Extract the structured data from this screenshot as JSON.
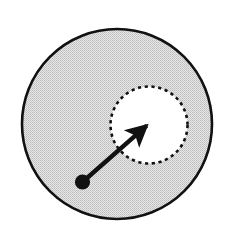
{
  "figure": {
    "canvas": {
      "width": 236,
      "height": 243,
      "background": "#ffffff"
    }
  },
  "shapes": {
    "outer_disk": {
      "name": "outer-disk",
      "role": "filled region boundary",
      "cx": 117,
      "cy": 124,
      "r": 95,
      "fill": "#d4d4d4",
      "fill_style": "halftone-dither",
      "stroke": "#111111",
      "stroke_width": 2.6,
      "stroke_style": "solid"
    },
    "inner_disk": {
      "name": "inner-disk",
      "role": "excluded hole",
      "cx": 149,
      "cy": 125,
      "r": 38.5,
      "fill": "#ffffff",
      "stroke": "#111111",
      "stroke_width": 2.6,
      "stroke_style": "dashed",
      "dash_array": "3.2 3.6"
    },
    "origin_point": {
      "name": "origin-point",
      "cx": 82.5,
      "cy": 182,
      "r": 7.6,
      "fill": "#111111"
    },
    "vector_arrow": {
      "name": "vector-arrow",
      "x1": 82.5,
      "y1": 182,
      "x2": 153,
      "y2": 120,
      "stroke": "#111111",
      "stroke_width": 4.4,
      "head_length": 20,
      "head_half_width": 7.5,
      "head_fill": "#111111"
    }
  },
  "colors": {
    "ink": "#111111",
    "gray_fill": "#d4d4d4",
    "white": "#ffffff"
  }
}
